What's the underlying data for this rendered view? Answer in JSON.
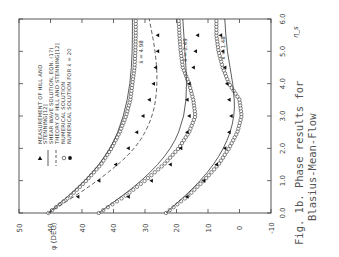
{
  "caption": {
    "line1": "Fig. 1b.  Phase results for",
    "line2": "Blasius-Mean-Flow"
  },
  "chart_data": {
    "type": "line",
    "orientation": "rotated 90 degrees counter-clockwise",
    "xlabel": "η_s",
    "ylabel": "φ (DEG)",
    "x_ticks": [
      "0.0",
      "1.0",
      "2.0",
      "3.0",
      "4.0",
      "5.0",
      "6.0"
    ],
    "xlim": [
      0,
      6
    ],
    "y_tick_labels": [
      "50",
      "40",
      "40",
      "40",
      "30",
      "20",
      "10",
      "0",
      "-10"
    ],
    "y_note": "Staggered phase axes: each curve family offset; main scale 50 to -10 degrees",
    "ylim": [
      -10,
      50
    ],
    "grid": false,
    "legend_position": "upper left (rotated)",
    "legend": [
      {
        "marker": "filled-triangle",
        "label": "MEASUREMENT OF HILL AND STENNING[12]"
      },
      {
        "marker": "solid-line",
        "label": "SHEAR WAVE SOLUTION, EQN. (17)"
      },
      {
        "marker": "dashed-line",
        "label": "THEORY OF HILL AND STENNING[12]"
      },
      {
        "marker": "open-circle",
        "label": "NUMERICAL SOLUTION"
      },
      {
        "marker": "filled-circle",
        "label": "NUMERICAL SOLUTION FOR x̄ = 20"
      }
    ],
    "annotations": [
      "x̄ = 4.98",
      "x̄ = 2.49",
      "x̄ = 1.48"
    ],
    "series": [
      {
        "name": "x̄ = 4.98 numerical",
        "x": [
          0.0,
          0.5,
          1.0,
          1.5,
          2.0,
          2.5,
          3.0,
          3.5,
          4.0,
          4.5,
          5.0,
          5.5,
          6.0
        ],
        "y": [
          43,
          38,
          34,
          30.5,
          28,
          26,
          24.5,
          23.5,
          23,
          22.5,
          22.3,
          22.2,
          22.2
        ]
      },
      {
        "name": "x̄ = 2.49 numerical",
        "x": [
          0.0,
          0.5,
          1.0,
          1.5,
          2.0,
          2.5,
          3.0,
          3.5,
          4.0,
          4.5,
          5.0,
          5.5,
          6.0
        ],
        "y": [
          31,
          25,
          20,
          15.5,
          12,
          9.5,
          8,
          8.5,
          9.5,
          11,
          11.5,
          11.8,
          12
        ]
      },
      {
        "name": "x̄ = 1.48 numerical",
        "x": [
          0.0,
          0.5,
          1.0,
          1.5,
          2.0,
          2.5,
          3.0,
          3.5,
          4.0,
          4.5,
          5.0,
          5.5,
          6.0
        ],
        "y": [
          15,
          10,
          6,
          2.5,
          0,
          -2,
          -3,
          -2.5,
          0,
          1.5,
          2.5,
          3,
          3
        ]
      },
      {
        "name": "shear wave x̄ = 4.98",
        "x": [
          0.0,
          1.0,
          2.0,
          3.0,
          4.0,
          5.0,
          6.0
        ],
        "y": [
          43,
          34,
          28,
          25,
          23.5,
          23,
          23
        ]
      },
      {
        "name": "shear wave x̄ = 2.49",
        "x": [
          0.0,
          1.0,
          2.0,
          3.0,
          4.0,
          5.0,
          6.0
        ],
        "y": [
          31,
          20.5,
          13.5,
          10.5,
          10,
          10.5,
          11
        ]
      },
      {
        "name": "shear wave x̄ = 1.48",
        "x": [
          0.0,
          1.0,
          2.0,
          3.0,
          4.0,
          5.0,
          6.0
        ],
        "y": [
          15,
          6.5,
          1,
          -1.5,
          -1,
          0.5,
          1
        ]
      },
      {
        "name": "Hill & Stenning theory (dashed)",
        "x": [
          0.0,
          1.0,
          2.0,
          3.0,
          4.0,
          5.0,
          6.0
        ],
        "y": [
          43,
          31,
          22,
          18,
          17,
          17.5,
          19
        ]
      },
      {
        "name": "Hill & Stenning measurement x̄ = 4.98",
        "x": [
          0.5,
          1.0,
          1.5,
          2.0,
          2.5,
          3.0,
          3.5,
          4.0,
          4.5,
          5.0,
          5.5
        ],
        "y": [
          36,
          31,
          27,
          24,
          22,
          20.5,
          19,
          18,
          17.5,
          17,
          17
        ]
      },
      {
        "name": "Hill & Stenning measurement x̄ = 2.49",
        "x": [
          0.5,
          1.0,
          1.5,
          2.0,
          2.5,
          3.0,
          3.5,
          4.0,
          4.5,
          5.0,
          5.5
        ],
        "y": [
          24,
          18.5,
          14,
          11.5,
          10,
          9.5,
          10,
          9.5,
          8.5,
          8,
          7.5
        ]
      },
      {
        "name": "Hill & Stenning measurement x̄ = 1.48",
        "x": [
          0.5,
          1.0,
          1.5,
          2.0,
          2.5,
          3.0,
          3.5,
          4.0,
          4.5,
          5.0,
          5.5
        ],
        "y": [
          10,
          6,
          3,
          1,
          0,
          -0.5,
          0,
          0.5,
          1,
          1.5,
          2
        ]
      }
    ]
  }
}
